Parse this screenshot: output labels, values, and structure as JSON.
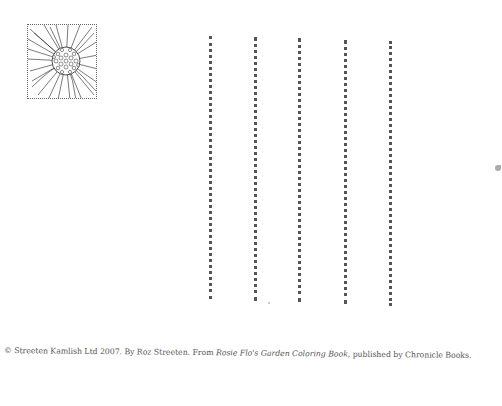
{
  "illustration": {
    "subject": "flower-head",
    "frame": "dotted-square"
  },
  "writing_lines": {
    "count": 5,
    "style": "dotted-vertical"
  },
  "credit": {
    "prefix": "© Streeten Kamlish Ltd 2007. By Roz Streeten. From ",
    "book_title": "Rosie Flo's Garden Coloring Book",
    "suffix": ", published by Chronicle Books."
  }
}
